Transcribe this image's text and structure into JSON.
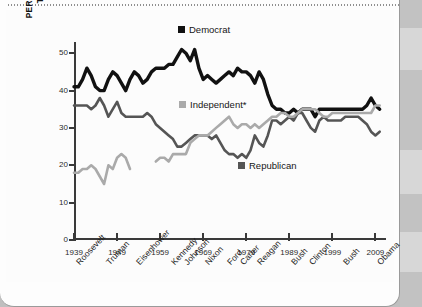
{
  "legend": {
    "democrat": {
      "label": "Democrat",
      "color": "#111111"
    },
    "independent": {
      "label": "Independent*",
      "color": "#aaaaaa"
    },
    "republican": {
      "label": "Republican",
      "color": "#555555"
    }
  },
  "axis": {
    "ylabel_line1": "PERCENTAGE IDENTIFYING",
    "ylabel_line2": "THEMSELVES AS . . .",
    "yticks": [
      "0",
      "10",
      "20",
      "30",
      "40",
      "50"
    ],
    "xticks": [
      "1939",
      "1949",
      "1959",
      "1969",
      "1979",
      "1989",
      "1999",
      "2009"
    ]
  },
  "presidents": [
    {
      "name": "Roosevelt",
      "year": 1939
    },
    {
      "name": "Truman",
      "year": 1946
    },
    {
      "name": "Eisenhower",
      "year": 1953
    },
    {
      "name": "Kennedy",
      "year": 1961
    },
    {
      "name": "Johnson",
      "year": 1964
    },
    {
      "name": "Nixon",
      "year": 1969
    },
    {
      "name": "Ford",
      "year": 1974
    },
    {
      "name": "Carter",
      "year": 1977
    },
    {
      "name": "Reagan",
      "year": 1981
    },
    {
      "name": "Bush",
      "year": 1989
    },
    {
      "name": "Clinton",
      "year": 1993
    },
    {
      "name": "Bush",
      "year": 2001
    },
    {
      "name": "Obama",
      "year": 2009
    }
  ],
  "chart_data": {
    "type": "line",
    "title": "",
    "xlabel": "",
    "ylabel": "PERCENTAGE IDENTIFYING THEMSELVES AS . . .",
    "xlim": [
      1939,
      2011
    ],
    "ylim": [
      0,
      53
    ],
    "grid": false,
    "legend_position": "inside",
    "series": [
      {
        "name": "Democrat",
        "color": "#111111",
        "points": [
          [
            1939,
            41
          ],
          [
            1940,
            41
          ],
          [
            1941,
            43
          ],
          [
            1942,
            46
          ],
          [
            1943,
            44
          ],
          [
            1944,
            41
          ],
          [
            1945,
            40
          ],
          [
            1946,
            40
          ],
          [
            1947,
            43
          ],
          [
            1948,
            45
          ],
          [
            1949,
            44
          ],
          [
            1950,
            42
          ],
          [
            1951,
            40
          ],
          [
            1952,
            43
          ],
          [
            1953,
            45
          ],
          [
            1954,
            44
          ],
          [
            1955,
            42
          ],
          [
            1956,
            43
          ],
          [
            1957,
            45
          ],
          [
            1958,
            46
          ],
          [
            1959,
            46
          ],
          [
            1960,
            46
          ],
          [
            1961,
            47
          ],
          [
            1962,
            47
          ],
          [
            1963,
            49
          ],
          [
            1964,
            51
          ],
          [
            1965,
            50
          ],
          [
            1966,
            48
          ],
          [
            1967,
            51
          ],
          [
            1968,
            46
          ],
          [
            1969,
            43
          ],
          [
            1970,
            44
          ],
          [
            1971,
            43
          ],
          [
            1972,
            42
          ],
          [
            1973,
            43
          ],
          [
            1974,
            44
          ],
          [
            1975,
            45
          ],
          [
            1976,
            44
          ],
          [
            1977,
            46
          ],
          [
            1978,
            45
          ],
          [
            1979,
            45
          ],
          [
            1980,
            44
          ],
          [
            1981,
            42
          ],
          [
            1982,
            45
          ],
          [
            1983,
            43
          ],
          [
            1984,
            39
          ],
          [
            1985,
            36
          ],
          [
            1986,
            35
          ],
          [
            1987,
            35
          ],
          [
            1988,
            34
          ],
          [
            1989,
            34
          ],
          [
            1990,
            35
          ],
          [
            1991,
            34
          ],
          [
            1992,
            35
          ],
          [
            1993,
            35
          ],
          [
            1994,
            35
          ],
          [
            1995,
            33
          ],
          [
            1996,
            35
          ],
          [
            1997,
            35
          ],
          [
            1998,
            35
          ],
          [
            1999,
            35
          ],
          [
            2000,
            35
          ],
          [
            2001,
            35
          ],
          [
            2002,
            35
          ],
          [
            2003,
            35
          ],
          [
            2004,
            35
          ],
          [
            2005,
            35
          ],
          [
            2006,
            35
          ],
          [
            2007,
            36
          ],
          [
            2008,
            38
          ],
          [
            2009,
            36
          ],
          [
            2010,
            35
          ]
        ]
      },
      {
        "name": "Republican",
        "color": "#555555",
        "points": [
          [
            1939,
            36
          ],
          [
            1940,
            36
          ],
          [
            1941,
            36
          ],
          [
            1942,
            36
          ],
          [
            1943,
            35
          ],
          [
            1944,
            36
          ],
          [
            1945,
            38
          ],
          [
            1946,
            36
          ],
          [
            1947,
            33
          ],
          [
            1948,
            35
          ],
          [
            1949,
            37
          ],
          [
            1950,
            34
          ],
          [
            1951,
            33
          ],
          [
            1952,
            33
          ],
          [
            1953,
            33
          ],
          [
            1954,
            33
          ],
          [
            1955,
            33
          ],
          [
            1956,
            34
          ],
          [
            1957,
            33
          ],
          [
            1958,
            31
          ],
          [
            1959,
            30
          ],
          [
            1960,
            29
          ],
          [
            1961,
            28
          ],
          [
            1962,
            27
          ],
          [
            1963,
            25
          ],
          [
            1964,
            25
          ],
          [
            1965,
            26
          ],
          [
            1966,
            27
          ],
          [
            1967,
            28
          ],
          [
            1968,
            28
          ],
          [
            1969,
            28
          ],
          [
            1970,
            28
          ],
          [
            1971,
            27
          ],
          [
            1972,
            28
          ],
          [
            1973,
            26
          ],
          [
            1974,
            24
          ],
          [
            1975,
            23
          ],
          [
            1976,
            23
          ],
          [
            1977,
            22
          ],
          [
            1978,
            23
          ],
          [
            1979,
            22
          ],
          [
            1980,
            24
          ],
          [
            1981,
            28
          ],
          [
            1982,
            26
          ],
          [
            1983,
            25
          ],
          [
            1984,
            28
          ],
          [
            1985,
            32
          ],
          [
            1986,
            32
          ],
          [
            1987,
            31
          ],
          [
            1988,
            32
          ],
          [
            1989,
            33
          ],
          [
            1990,
            32
          ],
          [
            1991,
            34
          ],
          [
            1992,
            34
          ],
          [
            1993,
            32
          ],
          [
            1994,
            30
          ],
          [
            1995,
            29
          ],
          [
            1996,
            32
          ],
          [
            1997,
            33
          ],
          [
            1998,
            32
          ],
          [
            1999,
            32
          ],
          [
            2000,
            32
          ],
          [
            2001,
            32
          ],
          [
            2002,
            33
          ],
          [
            2003,
            33
          ],
          [
            2004,
            33
          ],
          [
            2005,
            33
          ],
          [
            2006,
            32
          ],
          [
            2007,
            31
          ],
          [
            2008,
            29
          ],
          [
            2009,
            28
          ],
          [
            2010,
            29
          ]
        ]
      },
      {
        "name": "Independent",
        "color": "#aaaaaa",
        "points": [
          [
            1939,
            18
          ],
          [
            1940,
            18
          ],
          [
            1941,
            19
          ],
          [
            1942,
            19
          ],
          [
            1943,
            20
          ],
          [
            1944,
            19
          ],
          [
            1945,
            17
          ],
          [
            1946,
            15
          ],
          [
            1947,
            20
          ],
          [
            1948,
            19
          ],
          [
            1949,
            22
          ],
          [
            1950,
            23
          ],
          [
            1951,
            22
          ],
          [
            1952,
            19
          ],
          [
            1958,
            21
          ],
          [
            1959,
            22
          ],
          [
            1960,
            22
          ],
          [
            1961,
            21
          ],
          [
            1962,
            23
          ],
          [
            1963,
            23
          ],
          [
            1964,
            23
          ],
          [
            1965,
            23
          ],
          [
            1966,
            26
          ],
          [
            1967,
            27
          ],
          [
            1968,
            28
          ],
          [
            1969,
            28
          ],
          [
            1970,
            28
          ],
          [
            1971,
            29
          ],
          [
            1972,
            30
          ],
          [
            1973,
            31
          ],
          [
            1974,
            32
          ],
          [
            1975,
            33
          ],
          [
            1976,
            31
          ],
          [
            1977,
            30
          ],
          [
            1978,
            31
          ],
          [
            1979,
            31
          ],
          [
            1980,
            30
          ],
          [
            1981,
            31
          ],
          [
            1982,
            30
          ],
          [
            1983,
            31
          ],
          [
            1984,
            32
          ],
          [
            1985,
            33
          ],
          [
            1986,
            33
          ],
          [
            1987,
            34
          ],
          [
            1988,
            34
          ],
          [
            1989,
            33
          ],
          [
            1990,
            33
          ],
          [
            1991,
            34
          ],
          [
            1992,
            35
          ],
          [
            1993,
            35
          ],
          [
            1994,
            35
          ],
          [
            1995,
            35
          ],
          [
            1996,
            34
          ],
          [
            1997,
            33
          ],
          [
            1998,
            33
          ],
          [
            1999,
            34
          ],
          [
            2000,
            34
          ],
          [
            2001,
            34
          ],
          [
            2002,
            34
          ],
          [
            2003,
            34
          ],
          [
            2004,
            34
          ],
          [
            2005,
            34
          ],
          [
            2006,
            34
          ],
          [
            2007,
            34
          ],
          [
            2008,
            34
          ],
          [
            2009,
            36
          ],
          [
            2010,
            36
          ]
        ]
      }
    ]
  }
}
